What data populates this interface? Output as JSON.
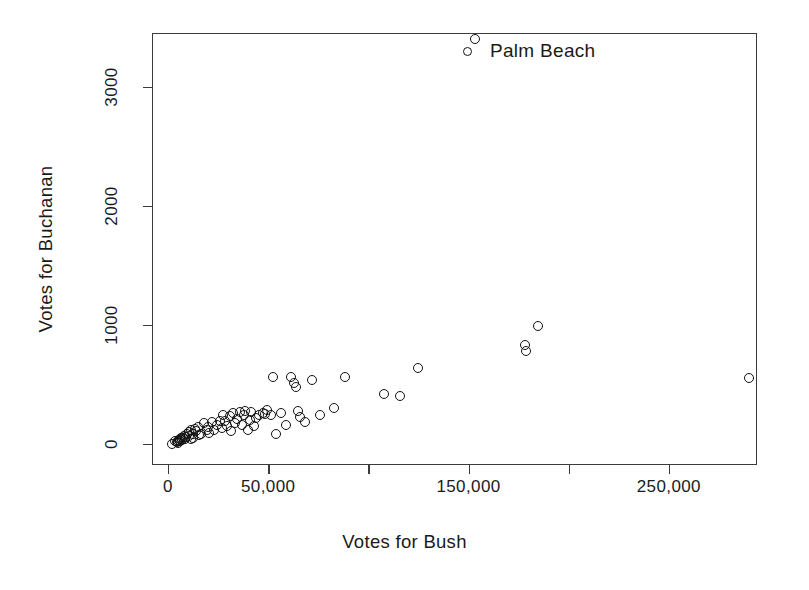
{
  "chart_data": {
    "type": "scatter",
    "title": "",
    "xlabel": "Votes for Bush",
    "ylabel": "Votes for Buchanan",
    "xlim": [
      -8000,
      294000
    ],
    "ylim": [
      -180,
      3450
    ],
    "grid": false,
    "legend_position": "none",
    "marker": "open-circle",
    "xticks": [
      0,
      50000,
      100000,
      150000,
      200000,
      250000
    ],
    "xticklabels": [
      "0",
      "50,000",
      "",
      "150,000",
      "",
      "250,000"
    ],
    "yticks": [
      0,
      1000,
      2000,
      3000
    ],
    "yticklabels": [
      "0",
      "1000",
      "2000",
      "3000"
    ],
    "annotations": [
      {
        "label": "Palm Beach",
        "marker": "open-circle",
        "x": 152846,
        "y": 3407
      }
    ],
    "series": [
      {
        "name": "Florida counties",
        "points": [
          {
            "x": 1316,
            "y": 9
          },
          {
            "x": 2873,
            "y": 29
          },
          {
            "x": 3962,
            "y": 22
          },
          {
            "x": 4256,
            "y": 17
          },
          {
            "x": 4512,
            "y": 30
          },
          {
            "x": 4985,
            "y": 38
          },
          {
            "x": 5413,
            "y": 26
          },
          {
            "x": 5610,
            "y": 48
          },
          {
            "x": 6060,
            "y": 52
          },
          {
            "x": 6443,
            "y": 36
          },
          {
            "x": 7049,
            "y": 58
          },
          {
            "x": 7671,
            "y": 73
          },
          {
            "x": 8177,
            "y": 45
          },
          {
            "x": 8672,
            "y": 65
          },
          {
            "x": 9138,
            "y": 89
          },
          {
            "x": 9893,
            "y": 76
          },
          {
            "x": 10005,
            "y": 103
          },
          {
            "x": 10733,
            "y": 48
          },
          {
            "x": 11062,
            "y": 122
          },
          {
            "x": 11827,
            "y": 90
          },
          {
            "x": 12176,
            "y": 55
          },
          {
            "x": 12882,
            "y": 133
          },
          {
            "x": 13439,
            "y": 110
          },
          {
            "x": 14630,
            "y": 145
          },
          {
            "x": 15196,
            "y": 78
          },
          {
            "x": 16059,
            "y": 92
          },
          {
            "x": 17427,
            "y": 182
          },
          {
            "x": 18850,
            "y": 120
          },
          {
            "x": 19696,
            "y": 150
          },
          {
            "x": 20196,
            "y": 96
          },
          {
            "x": 21271,
            "y": 188
          },
          {
            "x": 22338,
            "y": 120
          },
          {
            "x": 23983,
            "y": 165
          },
          {
            "x": 25249,
            "y": 195
          },
          {
            "x": 26216,
            "y": 138
          },
          {
            "x": 27164,
            "y": 248
          },
          {
            "x": 28188,
            "y": 202
          },
          {
            "x": 29060,
            "y": 155
          },
          {
            "x": 30268,
            "y": 238
          },
          {
            "x": 31123,
            "y": 112
          },
          {
            "x": 32089,
            "y": 268
          },
          {
            "x": 33054,
            "y": 182
          },
          {
            "x": 34124,
            "y": 214
          },
          {
            "x": 35419,
            "y": 275
          },
          {
            "x": 36248,
            "y": 165
          },
          {
            "x": 37255,
            "y": 248
          },
          {
            "x": 38142,
            "y": 286
          },
          {
            "x": 39497,
            "y": 124
          },
          {
            "x": 40403,
            "y": 208
          },
          {
            "x": 41035,
            "y": 271
          },
          {
            "x": 42182,
            "y": 158
          },
          {
            "x": 43618,
            "y": 226
          },
          {
            "x": 45156,
            "y": 247
          },
          {
            "x": 47134,
            "y": 262
          },
          {
            "x": 48119,
            "y": 255
          },
          {
            "x": 49118,
            "y": 288
          },
          {
            "x": 51012,
            "y": 252
          },
          {
            "x": 52088,
            "y": 570
          },
          {
            "x": 53420,
            "y": 92
          },
          {
            "x": 56031,
            "y": 262
          },
          {
            "x": 58162,
            "y": 167
          },
          {
            "x": 61042,
            "y": 570
          },
          {
            "x": 62318,
            "y": 515
          },
          {
            "x": 63152,
            "y": 486
          },
          {
            "x": 64147,
            "y": 283
          },
          {
            "x": 65348,
            "y": 232
          },
          {
            "x": 68104,
            "y": 192
          },
          {
            "x": 71149,
            "y": 542
          },
          {
            "x": 75293,
            "y": 250
          },
          {
            "x": 82145,
            "y": 310
          },
          {
            "x": 88021,
            "y": 572
          },
          {
            "x": 107101,
            "y": 428
          },
          {
            "x": 115185,
            "y": 412
          },
          {
            "x": 124112,
            "y": 645
          },
          {
            "x": 152846,
            "y": 3407
          },
          {
            "x": 177923,
            "y": 836
          },
          {
            "x": 178108,
            "y": 790
          },
          {
            "x": 184312,
            "y": 996
          },
          {
            "x": 289456,
            "y": 561
          }
        ]
      }
    ]
  }
}
